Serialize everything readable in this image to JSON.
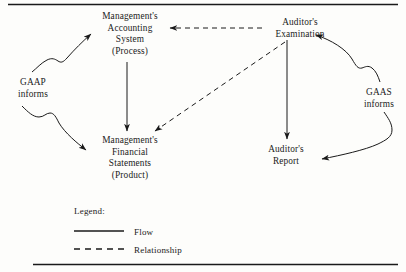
{
  "figure": {
    "rules": {
      "top_rule": "horizontal-rule",
      "bottom_rule": "horizontal-rule"
    }
  },
  "nodes": [
    {
      "id": "accounting-system",
      "lines": [
        "Management's",
        "Accounting",
        "System",
        "(Process)"
      ]
    },
    {
      "id": "auditors-examination",
      "lines": [
        "Auditor's",
        "Examination"
      ]
    },
    {
      "id": "financial-statements",
      "lines": [
        "Management's",
        "Financial",
        "Statements",
        "(Product)"
      ]
    },
    {
      "id": "auditors-report",
      "lines": [
        "Auditor's",
        "Report"
      ]
    }
  ],
  "side_labels": [
    {
      "id": "gaap",
      "lines": [
        "GAAP",
        "informs"
      ]
    },
    {
      "id": "gaas",
      "lines": [
        "GAAS",
        "informs"
      ]
    }
  ],
  "legend": {
    "heading": "Legend:",
    "items": [
      {
        "label": "Flow",
        "style": "solid"
      },
      {
        "label": "Relationship",
        "style": "dashed"
      }
    ]
  },
  "edges": [
    {
      "id": "accounting-to-statements",
      "style": "solid",
      "from": "accounting-system",
      "to": "financial-statements"
    },
    {
      "id": "exam-to-report",
      "style": "solid",
      "from": "auditors-examination",
      "to": "auditors-report"
    },
    {
      "id": "gaap-to-accounting",
      "style": "solid",
      "from": "gaap",
      "to": "accounting-system"
    },
    {
      "id": "gaap-to-statements",
      "style": "solid",
      "from": "gaap",
      "to": "financial-statements"
    },
    {
      "id": "gaas-to-exam",
      "style": "solid",
      "from": "gaas",
      "to": "auditors-examination"
    },
    {
      "id": "gaas-to-report",
      "style": "solid",
      "from": "gaas",
      "to": "auditors-report"
    },
    {
      "id": "exam-to-accounting",
      "style": "dashed",
      "from": "auditors-examination",
      "to": "accounting-system"
    },
    {
      "id": "exam-to-statements",
      "style": "dashed",
      "from": "auditors-examination",
      "to": "financial-statements"
    }
  ],
  "colors": {
    "ink": "#1a1a1a",
    "background": "#fdfdfb"
  }
}
